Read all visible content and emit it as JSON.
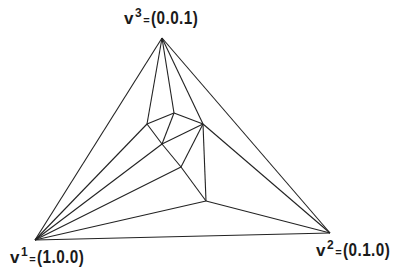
{
  "diagram": {
    "type": "simplex-subdivision",
    "line_color": "#222222",
    "vertices": {
      "v1": {
        "name": "v",
        "sup": "1",
        "eq": "=",
        "coord": "(1.0.0)",
        "x": 35,
        "y": 240
      },
      "v2": {
        "name": "v",
        "sup": "2",
        "eq": "=",
        "coord": "(0.1.0)",
        "x": 330,
        "y": 233
      },
      "v3": {
        "name": "v",
        "sup": "3",
        "eq": "=",
        "coord": "(0.0.1)",
        "x": 162,
        "y": 38
      }
    },
    "inner_nodes": {
      "A": {
        "x": 147,
        "y": 124
      },
      "B": {
        "x": 174,
        "y": 113
      },
      "C": {
        "x": 203,
        "y": 124
      },
      "D": {
        "x": 162,
        "y": 144
      },
      "E": {
        "x": 181,
        "y": 167
      },
      "F": {
        "x": 206,
        "y": 201
      }
    },
    "edges": [
      [
        "v1",
        "v2"
      ],
      [
        "v1",
        "v3"
      ],
      [
        "v2",
        "v3"
      ],
      [
        "v3",
        "A"
      ],
      [
        "v3",
        "B"
      ],
      [
        "v3",
        "C"
      ],
      [
        "A",
        "B"
      ],
      [
        "B",
        "C"
      ],
      [
        "A",
        "D"
      ],
      [
        "B",
        "D"
      ],
      [
        "D",
        "C"
      ],
      [
        "A",
        "v1"
      ],
      [
        "D",
        "E"
      ],
      [
        "E",
        "C"
      ],
      [
        "C",
        "F"
      ],
      [
        "E",
        "F"
      ],
      [
        "D",
        "v1"
      ],
      [
        "E",
        "v1"
      ],
      [
        "F",
        "v1"
      ],
      [
        "C",
        "v2"
      ],
      [
        "F",
        "v2"
      ]
    ]
  }
}
